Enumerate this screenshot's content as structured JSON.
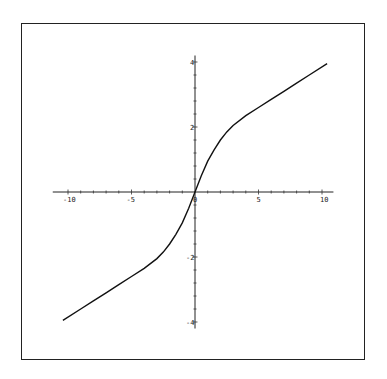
{
  "chart_data": {
    "type": "line",
    "title": "",
    "xlabel": "",
    "ylabel": "",
    "xlim": [
      -10.4,
      10.4
    ],
    "ylim": [
      -4,
      4
    ],
    "grid": false,
    "legend": null,
    "x_ticks": [
      "-10",
      "-5",
      "0",
      "5",
      "10"
    ],
    "y_ticks": [
      "-4",
      "-2",
      "2",
      "4"
    ],
    "series": [
      {
        "name": "curve",
        "x": [
          -10.4,
          -9,
          -8,
          -7,
          -6,
          -5,
          -4,
          -3,
          -2.5,
          -2,
          -1.5,
          -1,
          -0.5,
          0,
          0.5,
          1,
          1.5,
          2,
          2.5,
          3,
          4,
          5,
          6,
          7,
          8,
          9,
          10.4
        ],
        "y": [
          -3.95,
          -3.6,
          -3.35,
          -3.1,
          -2.85,
          -2.6,
          -2.35,
          -2.05,
          -1.85,
          -1.6,
          -1.3,
          -0.95,
          -0.5,
          0,
          0.5,
          0.95,
          1.3,
          1.6,
          1.85,
          2.05,
          2.35,
          2.6,
          2.85,
          3.1,
          3.35,
          3.6,
          3.95
        ]
      }
    ]
  }
}
